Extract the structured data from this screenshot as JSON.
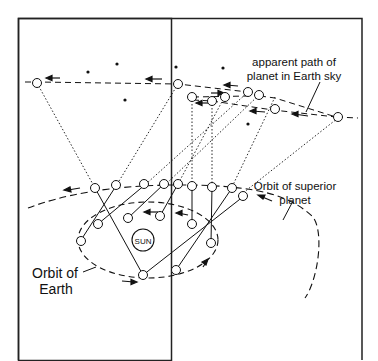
{
  "diagram": {
    "labels": {
      "sky_path_line1": "apparent path of",
      "sky_path_line2": "planet in Earth sky",
      "superior_orbit_line1": "Orbit of superior",
      "superior_orbit_line2": "planet",
      "earth_orbit_line1": "Orbit of",
      "earth_orbit_line2": "Earth",
      "sun": "SUN"
    },
    "colors": {
      "stroke": "#111111",
      "background": "#ffffff",
      "border": "#222222"
    }
  }
}
